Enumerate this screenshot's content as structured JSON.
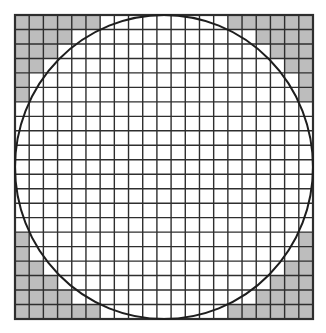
{
  "diagram": {
    "title": "",
    "grid": {
      "rows": 21,
      "cols": 21,
      "x": 15,
      "y": 15,
      "width": 298,
      "height": 304,
      "line_color": "#2e2e2e",
      "line_width": 1.4,
      "border_width": 2.2
    },
    "fill_color": "#bdbdbd",
    "background_color": "#ffffff",
    "circle": {
      "stroke_color": "#1e1e1e",
      "stroke_width": 2,
      "inscribed": true
    },
    "shaded_corners": {
      "description": "Cells outside the circle in each corner are shaded gray",
      "row_counts_from_edge": [
        6,
        4,
        3,
        2,
        1,
        1
      ]
    }
  }
}
